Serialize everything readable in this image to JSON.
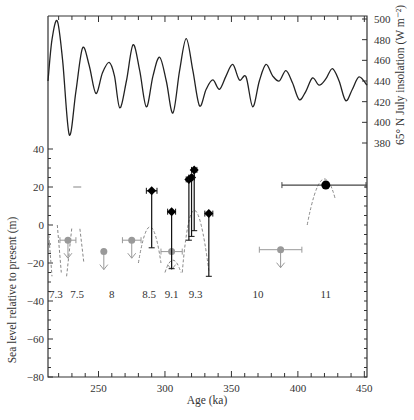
{
  "chart_data": [
    {
      "type": "line",
      "panel": "top",
      "title": "",
      "xlabel": "Age (ka)",
      "ylabel": "65° N July insolation (W m⁻²)",
      "yaxis_side": "right",
      "ylim": [
        380,
        500
      ],
      "yticks": [
        380,
        400,
        420,
        440,
        460,
        480,
        500
      ],
      "xlim": [
        212,
        452
      ],
      "series": [
        {
          "name": "65° N July insolation",
          "x": [
            212,
            215,
            219,
            223,
            228,
            233,
            238,
            243,
            248,
            253,
            258,
            262,
            266,
            271,
            276,
            281,
            286,
            291,
            296,
            301,
            306,
            311,
            316,
            321,
            326,
            331,
            336,
            341,
            346,
            351,
            356,
            361,
            366,
            371,
            376,
            381,
            386,
            391,
            396,
            401,
            406,
            411,
            416,
            421,
            426,
            431,
            436,
            441,
            446,
            452
          ],
          "values": [
            440,
            480,
            498,
            460,
            388,
            430,
            472,
            455,
            428,
            448,
            458,
            445,
            414,
            440,
            475,
            450,
            415,
            445,
            463,
            440,
            409,
            450,
            481,
            450,
            416,
            432,
            441,
            432,
            445,
            456,
            441,
            444,
            415,
            440,
            456,
            445,
            440,
            450,
            438,
            422,
            430,
            443,
            436,
            442,
            452,
            440,
            421,
            432,
            444,
            436
          ]
        }
      ],
      "grid": false
    },
    {
      "type": "scatter",
      "panel": "bottom",
      "title": "",
      "xlabel": "Age (ka)",
      "ylabel": "Sea level relative to present (m)",
      "xlim": [
        212,
        452
      ],
      "xticks": [
        250,
        300,
        350,
        400,
        450
      ],
      "ylim": [
        -80,
        40
      ],
      "yticks": [
        -80,
        -60,
        -40,
        -20,
        0,
        20,
        40
      ],
      "grid": false,
      "mis_labels": [
        {
          "label": "7.3",
          "x": 218
        },
        {
          "label": "7.5",
          "x": 234
        },
        {
          "label": "8",
          "x": 260
        },
        {
          "label": "8.5",
          "x": 288
        },
        {
          "label": "9.1",
          "x": 305
        },
        {
          "label": "9.3",
          "x": 323
        },
        {
          "label": "10",
          "x": 370
        },
        {
          "label": "11",
          "x": 421
        }
      ],
      "series": [
        {
          "name": "Black diamonds (sea-level highstands, with error bars)",
          "color": "#000000",
          "points": [
            {
              "x": 290,
              "y": 18,
              "xerr": 4,
              "ymin": -12,
              "ymax": 18
            },
            {
              "x": 305,
              "y": 7,
              "xerr": 3,
              "ymin": -23,
              "ymax": 7
            },
            {
              "x": 318,
              "y": 24,
              "xerr": 2,
              "ymin": -8,
              "ymax": 24
            },
            {
              "x": 320,
              "y": 25,
              "xerr": 2,
              "ymin": -6,
              "ymax": 25
            },
            {
              "x": 322,
              "y": 29,
              "xerr": 2,
              "ymin": -3,
              "ymax": 29
            },
            {
              "x": 333,
              "y": 6,
              "xerr": 3,
              "ymin": -27,
              "ymax": 6
            }
          ]
        },
        {
          "name": "Black circle (MIS 11)",
          "color": "#000000",
          "points": [
            {
              "x": 421,
              "y": 21,
              "xmin": 388,
              "xmax": 452
            }
          ]
        },
        {
          "name": "Grey points (upper limits)",
          "color": "#888888",
          "points": [
            {
              "x": 227,
              "y": -8,
              "xerr": 6,
              "limit": "upper"
            },
            {
              "x": 254,
              "y": -14,
              "limit": "upper"
            },
            {
              "x": 275,
              "y": -8,
              "xerr": 7,
              "limit": "upper"
            },
            {
              "x": 305,
              "y": -14,
              "xerr": 8,
              "limit": "upper"
            },
            {
              "x": 387,
              "y": -13,
              "xerr": 16,
              "limit": "upper"
            }
          ]
        },
        {
          "name": "Grey bar (MIS 7.5)",
          "color": "#888888",
          "points": [
            {
              "x": 234,
              "y": 20
            }
          ]
        }
      ]
    }
  ],
  "axes": {
    "x_title": "Age (ka)",
    "left_title": "Sea level relative to present (m)",
    "right_title": "65° N July insolation (W m⁻²)"
  }
}
